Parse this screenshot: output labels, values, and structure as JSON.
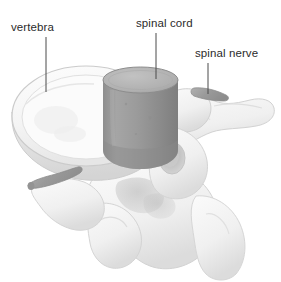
{
  "figure": {
    "width": 281,
    "height": 282,
    "background_color": "#ffffff"
  },
  "labels": [
    {
      "id": "vertebra",
      "text": "vertebra",
      "x": 11,
      "y": 21,
      "leader_line": {
        "x1": 46,
        "y1": 37,
        "x2": 46,
        "y2": 92
      }
    },
    {
      "id": "spinal-cord",
      "text": "spinal cord",
      "x": 136,
      "y": 17,
      "leader_line": {
        "x1": 156,
        "y1": 33,
        "x2": 156,
        "y2": 79
      }
    },
    {
      "id": "spinal-nerve",
      "text": "spinal nerve",
      "x": 195,
      "y": 47,
      "leader_line": {
        "x1": 208,
        "y1": 63,
        "x2": 208,
        "y2": 94
      }
    }
  ],
  "colors": {
    "background": "#ffffff",
    "label_text": "#2b2b2b",
    "leader_line": "#4a4a4a",
    "bone_fill": "#f7f7f7",
    "bone_shadow": "#e2e2e2",
    "bone_outline": "#cfcfcf",
    "bone_deep_shadow": "#c8c8c8",
    "cord_body": "#9a9a9a",
    "cord_top": "#b4b4b4",
    "cord_rim": "#8a8a8a",
    "nerve_gray": "#9c9c9c",
    "foramen_shadow": "#bdbdbd"
  },
  "anatomy": {
    "vertebral_body": {
      "name": "vertebral body",
      "center_x": 86,
      "center_y": 120,
      "rx": 74,
      "ry": 52
    },
    "spinal_cord": {
      "name": "spinal cord",
      "left": 103,
      "top": 68,
      "width": 75,
      "height": 97,
      "cap_ry": 13
    },
    "spinal_nerve_right": {
      "name": "right spinal nerve root",
      "x1": 196,
      "y1": 90,
      "x2": 226,
      "y2": 97
    },
    "spinal_nerve_left": {
      "name": "left spinal nerve root",
      "x1": 28,
      "y1": 183,
      "x2": 76,
      "y2": 168
    },
    "transverse_process_right": {
      "name": "right transverse process"
    },
    "transverse_process_left": {
      "name": "left transverse process"
    },
    "spinous_process": {
      "name": "spinous process"
    },
    "lamina": {
      "name": "lamina"
    },
    "superior_articular_process": {
      "name": "superior articular process"
    }
  }
}
